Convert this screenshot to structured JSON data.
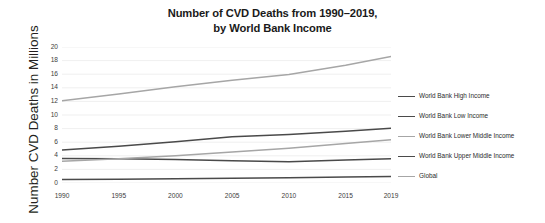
{
  "chart_data": {
    "type": "line",
    "title": "Number of CVD Deaths from 1990–2019, by World Bank Income",
    "title_line1": "Number of CVD Deaths from 1990–2019,",
    "title_line2": "by World Bank Income",
    "xlabel": "",
    "ylabel": "Number CVD Deaths in Millions",
    "x": [
      1990,
      1995,
      2000,
      2005,
      2010,
      2015,
      2019
    ],
    "xlim": [
      1990,
      2019
    ],
    "ylim": [
      0,
      20
    ],
    "ytick_labels": [
      "0",
      "2",
      "4",
      "6",
      "8",
      "10",
      "12",
      "14",
      "16",
      "18",
      "20"
    ],
    "ytick_values": [
      0,
      2,
      4,
      6,
      8,
      10,
      12,
      14,
      16,
      18,
      20
    ],
    "xtick_labels": [
      "1990",
      "1995",
      "2000",
      "2005",
      "2010",
      "2015",
      "2019"
    ],
    "grid": "horizontal",
    "legend_position": "right",
    "series": [
      {
        "name": "World Bank High Income",
        "color": "#4a4a4a",
        "values": [
          3.6,
          3.58,
          3.45,
          3.28,
          3.12,
          3.38,
          3.58
        ]
      },
      {
        "name": "World Bank Low Income",
        "color": "#4a4a4a",
        "values": [
          0.5,
          0.55,
          0.62,
          0.7,
          0.78,
          0.88,
          0.95
        ]
      },
      {
        "name": "World Bank Lower Middle Income",
        "color": "#a6a6a6",
        "values": [
          3.2,
          3.55,
          4.0,
          4.55,
          5.1,
          5.8,
          6.35
        ]
      },
      {
        "name": "World Bank Upper Middle Income",
        "color": "#4a4a4a",
        "values": [
          4.85,
          5.4,
          6.05,
          6.8,
          7.15,
          7.62,
          8.05
        ]
      },
      {
        "name": "Global",
        "color": "#a6a6a6",
        "values": [
          12.1,
          13.1,
          14.15,
          15.1,
          15.95,
          17.3,
          18.6
        ]
      }
    ]
  },
  "legend": {
    "items": [
      {
        "label": "World Bank High Income",
        "color": "#4a4a4a"
      },
      {
        "label": "World Bank Low Income",
        "color": "#4a4a4a"
      },
      {
        "label": "World Bank Lower Middle Income",
        "color": "#a6a6a6"
      },
      {
        "label": "World Bank Upper Middle Income",
        "color": "#4a4a4a"
      },
      {
        "label": "Global",
        "color": "#a6a6a6"
      }
    ]
  },
  "style": {
    "background": "#ffffff",
    "gridline_color": "#ebebeb",
    "axis_text_color": "#3d3d3d",
    "title_color": "#1a1a1a"
  }
}
